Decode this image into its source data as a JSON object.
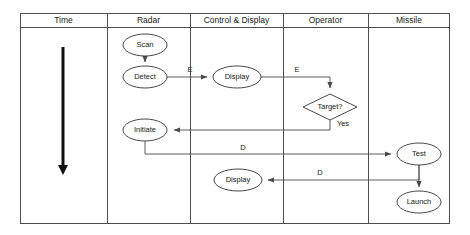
{
  "diagram": {
    "frame": {
      "x": 20,
      "y": 13,
      "width": 430,
      "height": 211,
      "header_height": 14
    },
    "lanes": [
      {
        "id": "time",
        "label": "Time",
        "x": 20,
        "width": 87
      },
      {
        "id": "radar",
        "label": "Radar",
        "x": 107,
        "width": 83
      },
      {
        "id": "control",
        "label": "Control & Display",
        "x": 190,
        "width": 93
      },
      {
        "id": "operator",
        "label": "Operator",
        "x": 283,
        "width": 85
      },
      {
        "id": "missile",
        "label": "Missile",
        "x": 368,
        "width": 82
      }
    ],
    "nodes": [
      {
        "id": "scan",
        "label": "Scan",
        "shape": "ellipse",
        "cx": 145,
        "cy": 45,
        "rx": 22,
        "ry": 11
      },
      {
        "id": "detect",
        "label": "Detect",
        "shape": "ellipse",
        "cx": 145,
        "cy": 77,
        "rx": 22,
        "ry": 11
      },
      {
        "id": "display1",
        "label": "Display",
        "shape": "ellipse",
        "cx": 237,
        "cy": 77,
        "rx": 24,
        "ry": 11
      },
      {
        "id": "target",
        "label": "Target?",
        "shape": "diamond",
        "cx": 330,
        "cy": 107,
        "rx": 27,
        "ry": 13
      },
      {
        "id": "initiate",
        "label": "Initiate",
        "shape": "ellipse",
        "cx": 145,
        "cy": 130,
        "rx": 22,
        "ry": 11
      },
      {
        "id": "test",
        "label": "Test",
        "shape": "ellipse",
        "cx": 419,
        "cy": 154,
        "rx": 22,
        "ry": 11
      },
      {
        "id": "display2",
        "label": "Display",
        "shape": "ellipse",
        "cx": 238,
        "cy": 180,
        "rx": 24,
        "ry": 11
      },
      {
        "id": "launch",
        "label": "Launch",
        "shape": "ellipse",
        "cx": 419,
        "cy": 202,
        "rx": 22,
        "ry": 11
      }
    ],
    "edges": [
      {
        "id": "scan-to-detect",
        "from": "scan",
        "to": "detect",
        "label": "",
        "label_x": 0,
        "label_y": 0
      },
      {
        "id": "detect-to-display1",
        "from": "detect",
        "to": "display1",
        "label": "E",
        "label_x": 190,
        "label_y": 70
      },
      {
        "id": "display1-to-target",
        "from": "display1",
        "to": "target",
        "label": "E",
        "label_x": 297,
        "label_y": 70
      },
      {
        "id": "target-to-initiate",
        "from": "target",
        "to": "initiate",
        "label": "Yes",
        "label_x": 343,
        "label_y": 124
      },
      {
        "id": "initiate-to-test",
        "from": "initiate",
        "to": "test",
        "label": "D",
        "label_x": 243,
        "label_y": 149
      },
      {
        "id": "test-to-display2",
        "from": "test",
        "to": "display2",
        "label": "D",
        "label_x": 320,
        "label_y": 174
      },
      {
        "id": "test-to-launch",
        "from": "test",
        "to": "launch",
        "label": "",
        "label_x": 0,
        "label_y": 0
      }
    ],
    "time_axis": {
      "label": "time-direction-arrow",
      "x": 63,
      "y_start": 47,
      "y_end": 176
    }
  }
}
